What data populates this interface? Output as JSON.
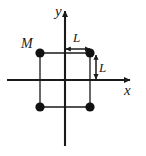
{
  "figure": {
    "type": "physics-diagram",
    "background_color": "#ffffff",
    "ink_color": "#1a1a1a",
    "width": 146,
    "height": 156
  },
  "axes": {
    "x_axis": {
      "label": "x",
      "label_x": 124,
      "label_y": 95,
      "line_y": 80,
      "line_x_start": 7,
      "line_x_end": 130,
      "arrow": "right"
    },
    "y_axis": {
      "label": "y",
      "label_x": 55,
      "label_y": 16,
      "line_x": 65,
      "line_y_start": 11,
      "line_y_end": 146,
      "arrow": "up"
    },
    "origin": {
      "x": 65,
      "y": 80
    }
  },
  "square": {
    "side_label": "L",
    "half_side_px": 25,
    "stroke_width": 1.3,
    "corners": [
      {
        "id": "top-left",
        "x": 40,
        "y": 53
      },
      {
        "id": "top-right",
        "x": 90,
        "y": 53
      },
      {
        "id": "bottom-right",
        "x": 90,
        "y": 107
      },
      {
        "id": "bottom-left",
        "x": 40,
        "y": 107
      }
    ]
  },
  "masses": {
    "label": "M",
    "label_x": 21,
    "label_y": 48,
    "radius": 4.6,
    "fill": "#111111",
    "count": 4
  },
  "dimensions": [
    {
      "id": "horizontal-L",
      "label": "L",
      "label_x": 73,
      "label_y": 42,
      "orientation": "horizontal",
      "from_x": 66,
      "to_x": 90,
      "at_y": 49
    },
    {
      "id": "vertical-L",
      "label": "L",
      "label_x": 99,
      "label_y": 72,
      "orientation": "vertical",
      "from_y": 55,
      "to_y": 79,
      "at_x": 96
    }
  ]
}
